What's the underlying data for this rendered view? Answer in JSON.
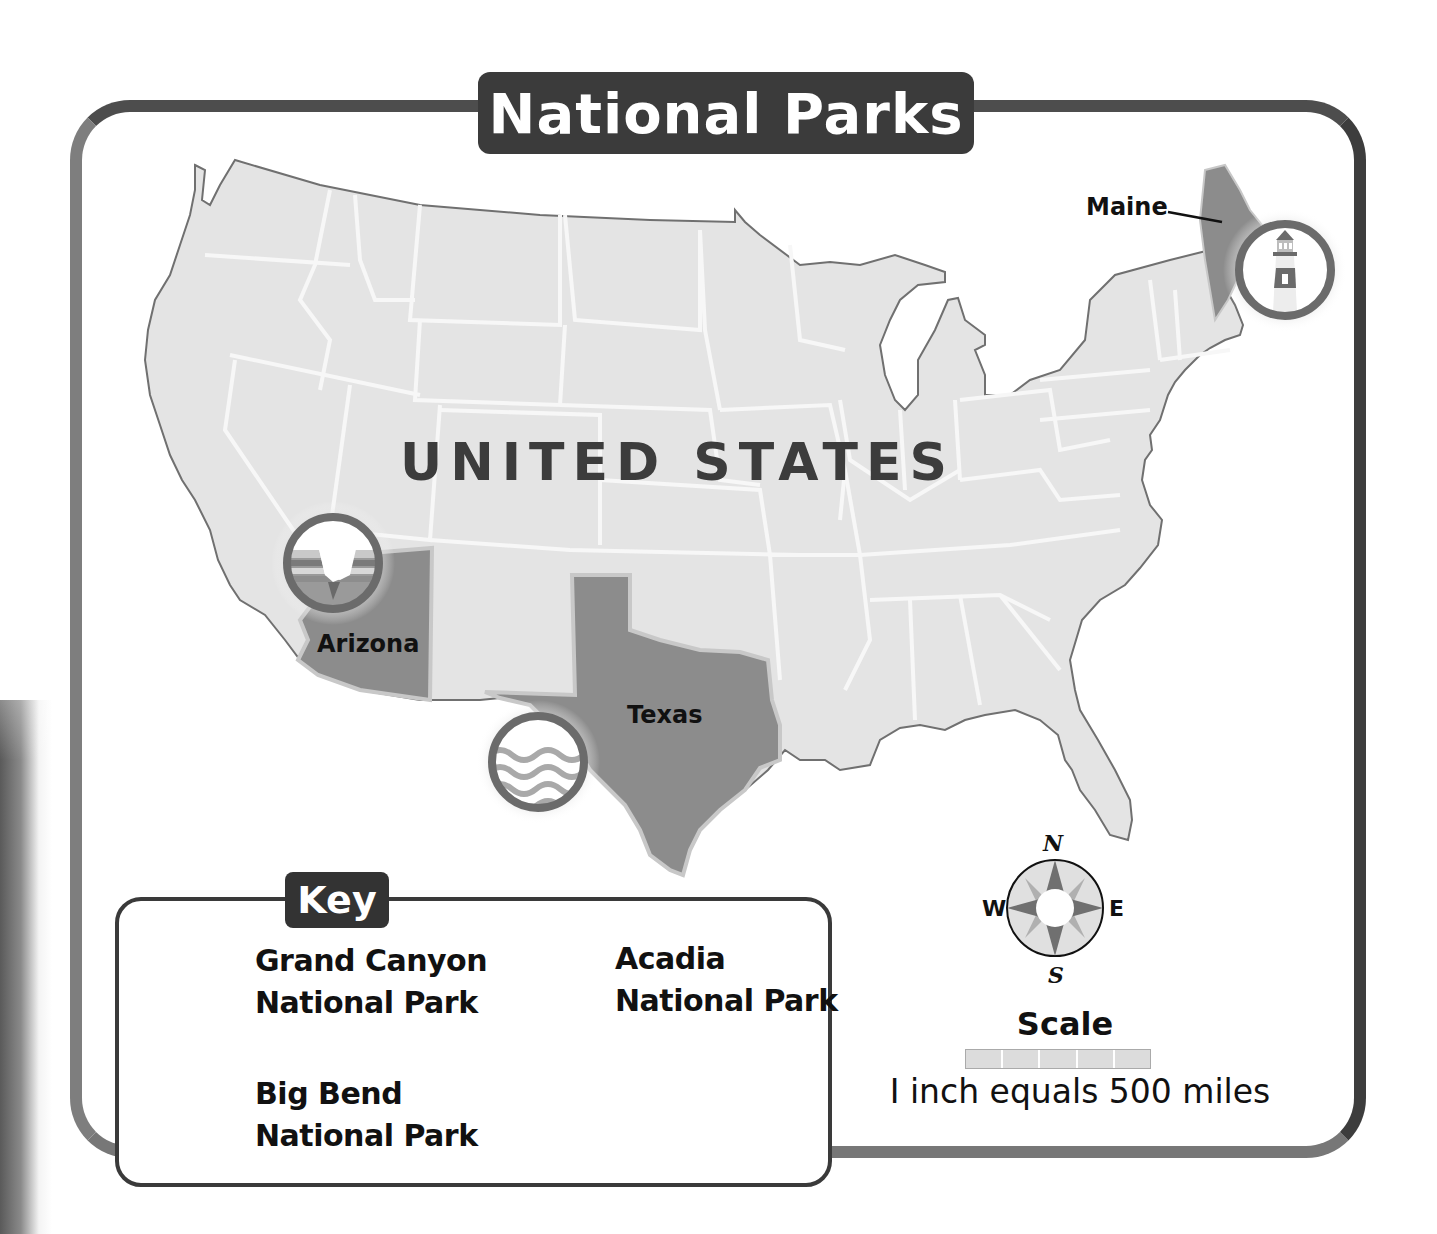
{
  "title": "National Parks",
  "map": {
    "country_label": "UNITED STATES",
    "states": [
      {
        "name": "Arizona",
        "label": "Arizona",
        "highlighted": true
      },
      {
        "name": "Texas",
        "label": "Texas",
        "highlighted": true
      },
      {
        "name": "Maine",
        "label": "Maine",
        "highlighted": true
      }
    ],
    "markers": [
      {
        "park": "Grand Canyon National Park",
        "icon": "canyon-icon",
        "state": "Arizona"
      },
      {
        "park": "Big Bend National Park",
        "icon": "waves-icon",
        "state": "Texas"
      },
      {
        "park": "Acadia National Park",
        "icon": "lighthouse-icon",
        "state": "Maine"
      }
    ],
    "colors": {
      "land": "#e4e4e4",
      "state_border": "#f5f5f5",
      "highlight": "#8c8c8c",
      "coast": "#6e6e6e",
      "icon_ring": "#6b6b6b"
    }
  },
  "key": {
    "title": "Key",
    "items": [
      {
        "line1": "Grand Canyon",
        "line2": "National Park",
        "icon": "canyon-icon"
      },
      {
        "line1": "Acadia",
        "line2": "National Park",
        "icon": "lighthouse-icon"
      },
      {
        "line1": "Big Bend",
        "line2": "National Park",
        "icon": "waves-icon"
      }
    ]
  },
  "compass": {
    "n": "N",
    "e": "E",
    "s": "S",
    "w": "W"
  },
  "scale": {
    "title": "Scale",
    "segments": 5,
    "text": "I inch equals 500 miles"
  }
}
